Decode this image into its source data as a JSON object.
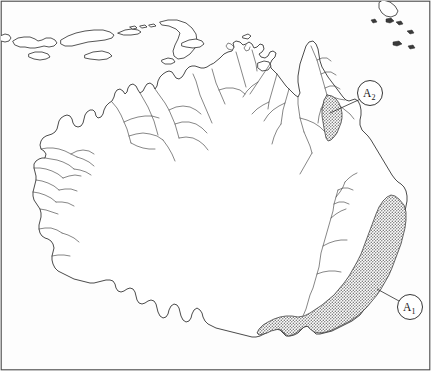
{
  "figure": {
    "background_color": "#fefefe",
    "frame_color": "#4a4a4a",
    "coast_color": "#2b2b2b",
    "river_color": "#3c3c3c",
    "shade_color": "#8d8d8d",
    "width": 431,
    "height": 371
  },
  "labels": [
    {
      "id": "A2",
      "base": "A",
      "subscript": "2",
      "name": "label-a2",
      "circle": {
        "cx": 370,
        "cy": 93,
        "r": 12.5
      },
      "leader": {
        "x1": 359.5,
        "y1": 99.5,
        "x2": 330,
        "y2": 113
      },
      "region": "northeast-cape-york"
    },
    {
      "id": "A1",
      "base": "A",
      "subscript": "1",
      "name": "label-a1",
      "circle": {
        "cx": 410,
        "cy": 307,
        "r": 12.5
      },
      "leader": {
        "x1": 399,
        "y1": 301,
        "x2": 377,
        "y2": 289
      },
      "region": "southeast-great-dividing-range"
    }
  ],
  "shaded_regions": [
    {
      "name": "shaded-region-a2",
      "label": "A2",
      "description": "Stippled band along the east coast of Cape York Peninsula"
    },
    {
      "name": "shaded-region-a1",
      "label": "A1",
      "description": "Stippled band along the east coast from southern Queensland through New South Wales into Victoria"
    }
  ],
  "landmasses": [
    {
      "name": "australia-mainland",
      "kind": "continent"
    },
    {
      "name": "lesser-sunda-islands",
      "kind": "island-chain"
    },
    {
      "name": "timor-island",
      "kind": "island"
    },
    {
      "name": "new-guinea-fragment",
      "kind": "island"
    },
    {
      "name": "torres-strait-islets",
      "kind": "islets"
    }
  ],
  "geometry": {
    "mainland_path": "M 88 165 L 84 160 L 80 156 L 78 150 L 76 144 L 74 138 L 73 132 L 72 126 L 72 120 L 74 115 L 77 112 L 80 110 L 83 110 L 85 112 L 86 116 L 88 120 L 91 122 L 94 121 L 96 118 L 97 114 L 99 110 L 102 107 L 105 105 L 107 101 L 108 97 L 110 93 L 113 91 L 116 92 L 119 95 L 121 92 L 123 88 L 126 87 L 128 90 L 130 93 L 132 90 L 134 86 L 137 85 L 139 88 L 141 91 L 144 90 L 146 86 L 149 84 L 152 85 L 154 88 L 156 86 L 157 82 L 159 79 L 162 77 L 166 76 L 170 75 L 174 74 L 178 73 L 182 72 L 186 71 L 190 70 L 194 69 L 198 68 L 202 67 L 206 67 L 210 68 L 214 69 L 218 69 L 222 68 L 226 67 L 230 66 L 234 65 L 238 64 L 240 60 L 241 56 L 243 53 L 246 52 L 248 55 L 249 59 L 248 63 L 247 67 L 249 70 L 252 72 L 255 74 L 253 78 L 250 81 L 248 85 L 247 89 L 248 93 L 250 96 L 253 99 L 256 103 L 259 107 L 262 111 L 265 115 L 268 119 L 271 122 L 275 124 L 279 125 L 283 125 L 287 124 L 290 121 L 292 117 L 293 112 L 294 107 L 295 102 L 296 97 L 297 91 L 298 85 L 299 79 L 300 72 L 301 65 L 303 59 L 305 53 L 307 48 L 310 45 L 313 46 L 315 50 L 317 55 L 318 61 L 320 67 L 322 72 L 325 76 L 328 79 L 331 82 L 334 86 L 337 90 L 340 94 L 343 98 L 346 101 L 349 103 L 352 105 L 355 108 L 357 112 L 359 116 L 361 121 L 363 126 L 365 131 L 367 136 L 369 141 L 371 146 L 373 151 L 375 156 L 377 161 L 379 166 L 381 171 L 383 176 L 385 181 L 387 186 L 389 191 L 391 196 L 393 200 L 396 203 L 399 205 L 402 207 L 404 211 L 405 216 L 405 221 L 404 226 L 403 231 L 402 236 L 401 241 L 400 246 L 399 251 L 398 256 L 396 261 L 394 266 L 392 271 L 390 276 L 388 281 L 386 286 L 383 291 L 380 296 L 377 300 L 374 304 L 371 308 L 368 312 L 365 316 L 361 319 L 357 322 L 353 324 L 349 326 L 345 329 L 341 332 L 337 334 L 333 336 L 329 337 L 325 338 L 321 338 L 317 337 L 313 336 L 309 336 L 305 337 L 301 339 L 297 341 L 293 342 L 289 342 L 285 341 L 281 339 L 277 338 L 273 338 L 269 339 L 265 340 L 261 341 L 257 341 L 253 340 L 249 338 L 245 337 L 241 336 L 237 335 L 233 334 L 229 332 L 225 330 L 221 328 L 217 326 L 213 324 L 209 322 L 205 320 L 201 318 L 197 316 L 193 313 L 189 310 L 185 307 L 181 304 L 177 301 L 173 299 L 169 297 L 165 295 L 161 293 L 157 291 L 153 289 L 149 287 L 145 286 L 141 285 L 137 284 L 133 283 L 129 282 L 125 281 L 121 280 L 117 279 L 113 278 L 109 277 L 105 276 L 101 275 L 97 273 L 93 271 L 89 269 L 86 266 L 84 262 L 83 258 L 83 254 L 84 250 L 85 246 L 84 242 L 82 238 L 80 234 L 78 230 L 77 226 L 77 222 L 78 218 L 79 214 L 79 210 L 78 206 L 77 202 L 77 198 L 78 194 L 80 190 L 82 186 L 83 182 L 84 178 L 85 174 L 86 170 Z"
  }
}
